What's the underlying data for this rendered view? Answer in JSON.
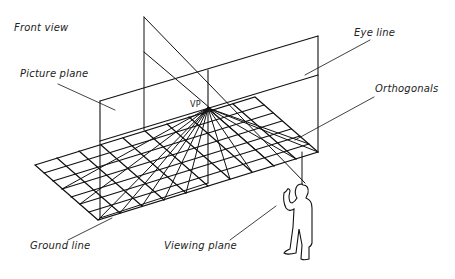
{
  "diagram": {
    "type": "perspective-setup",
    "labels": {
      "front_view": "Front view",
      "eye_line": "Eye line",
      "picture_plane": "Picture plane",
      "orthogonals": "Orthogonals",
      "vp": "VP",
      "ground_line": "Ground line",
      "viewing_plane": "Viewing plane"
    },
    "colors": {
      "ink": "#111111",
      "background": "#ffffff"
    }
  }
}
